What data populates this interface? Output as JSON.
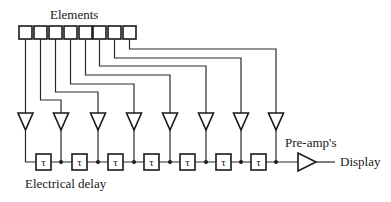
{
  "diagram": {
    "title_label": "Elements",
    "delay_label": "Electrical delay",
    "preamp_label": "Pre-amp's",
    "output_label": "Display",
    "delay_symbol": "τ",
    "element_count": 8,
    "delay_count": 7,
    "colors": {
      "line": "#2a2a2a",
      "background": "#ffffff",
      "text": "#1a1a1a"
    }
  },
  "elements": [
    {
      "id": 1,
      "x": 19,
      "route_y": null,
      "amp_x": 25
    },
    {
      "id": 2,
      "x": 34,
      "route_y": null,
      "amp_x": 61
    },
    {
      "id": 3,
      "x": 49,
      "route_y": 92,
      "amp_x": 98
    },
    {
      "id": 4,
      "x": 64,
      "route_y": 84,
      "amp_x": 134
    },
    {
      "id": 5,
      "x": 79,
      "route_y": 75,
      "amp_x": 170
    },
    {
      "id": 6,
      "x": 93,
      "route_y": 66,
      "amp_x": 206
    },
    {
      "id": 7,
      "x": 108,
      "route_y": 58,
      "amp_x": 241
    },
    {
      "id": 8,
      "x": 123,
      "route_y": 49,
      "amp_x": 276
    }
  ],
  "delays": [
    {
      "cx": 43
    },
    {
      "cx": 79
    },
    {
      "cx": 115
    },
    {
      "cx": 151
    },
    {
      "cx": 188
    },
    {
      "cx": 224
    },
    {
      "cx": 259
    }
  ]
}
